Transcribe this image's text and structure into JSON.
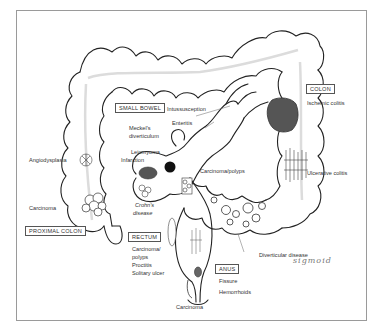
{
  "diagram": {
    "regions": {
      "small_bowel": {
        "label": "SMALL BOWEL",
        "conditions": [
          "Intussusception",
          "Enteritis",
          "Meckel's diverticulum",
          "Leiomyoma",
          "Infarction",
          "Crohn's disease",
          "Carcinoma/polyps"
        ]
      },
      "colon": {
        "label": "COLON",
        "conditions": [
          "Ischemic colitis",
          "Ulcerative colitis",
          "Diverticular disease"
        ]
      },
      "proximal_colon": {
        "label": "PROXIMAL COLON",
        "conditions": [
          "Angiodysplasia",
          "Carcinoma"
        ]
      },
      "rectum": {
        "label": "RECTUM",
        "conditions": [
          "Carcinoma/ polyps",
          "Proctitis",
          "Solitary ulcer"
        ]
      },
      "anus": {
        "label": "ANUS",
        "conditions": [
          "Fissure",
          "Hemorrhoids",
          "Carcinoma"
        ]
      }
    },
    "labels": {
      "small_bowel_box": "SMALL BOWEL",
      "intussusception": "Intussusception",
      "enteritis": "Enteritis",
      "meckels_1": "Meckel's",
      "meckels_2": "diverticulum",
      "leiomyoma": "Leiomyoma",
      "infarction": "Infarction",
      "crohns_1": "Crohn's",
      "crohns_2": "disease",
      "carcinoma_polyps": "Carcinoma/polyps",
      "colon_box": "COLON",
      "ischemic_colitis": "Ischemic colitis",
      "ulcerative_colitis": "Ulcerative colitis",
      "diverticular_disease": "Diverticular disease",
      "handwritten_note": "sigmoid",
      "angiodysplasia": "Angiodysplasia",
      "proximal_carcinoma": "Carcinoma",
      "proximal_colon_box": "PROXIMAL COLON",
      "rectum_box": "RECTUM",
      "rectum_carcinoma": "Carcinoma/",
      "rectum_polyps": "polyps",
      "proctitis": "Proctitis",
      "solitary_ulcer": "Solitary ulcer",
      "anus_box": "ANUS",
      "fissure": "Fissure",
      "hemorrhoids": "Hemorrhoids",
      "anal_carcinoma": "Carcinoma"
    },
    "colors": {
      "outline": "#222222",
      "lesion_fill": "#555555",
      "dark_lesion": "#111111",
      "lumen_line": "#dddddd",
      "frame": "#9a9a9a"
    }
  }
}
